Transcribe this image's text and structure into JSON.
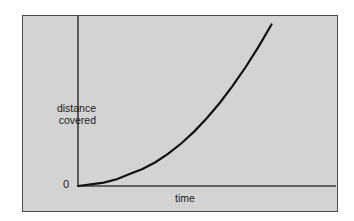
{
  "figure": {
    "panel_background": "#d3d3d3",
    "panel_border_color": "#4a4a4a",
    "axis_color": "#3c3c3c",
    "curve_color": "#111111",
    "top_strip_ghost_text": "i ii i i i ii i i"
  },
  "chart_data": {
    "type": "line",
    "title": "",
    "subtitle": "",
    "xlabel": "time",
    "ylabel_line1": "distance",
    "ylabel_line2": "covered",
    "origin_label": "0",
    "grid": false,
    "legend": null,
    "legend_position": "none",
    "xlim": [
      0,
      1
    ],
    "ylim": [
      0,
      1
    ],
    "x_tick_labels": [],
    "y_tick_labels": [],
    "annotations": [],
    "series": [
      {
        "name": "distance covered",
        "description": "monotonically increasing convex curve (accelerating motion)",
        "x": [
          0.0,
          0.05,
          0.1,
          0.15,
          0.2,
          0.25,
          0.3,
          0.35,
          0.4,
          0.45,
          0.5,
          0.55,
          0.6,
          0.65,
          0.7,
          0.75
        ],
        "y": [
          0.0,
          0.01,
          0.02,
          0.04,
          0.07,
          0.1,
          0.14,
          0.19,
          0.25,
          0.32,
          0.4,
          0.49,
          0.59,
          0.7,
          0.82,
          0.95
        ]
      }
    ]
  }
}
